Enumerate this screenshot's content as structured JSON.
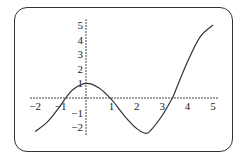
{
  "chart_data": {
    "type": "line",
    "title": "",
    "xlabel": "",
    "ylabel": "",
    "xlim": [
      -2,
      5
    ],
    "ylim": [
      -2.4,
      5.2
    ],
    "grid": false,
    "legend": null,
    "x_ticks": [
      "-2",
      "-1",
      "1",
      "2",
      "3",
      "4",
      "5"
    ],
    "y_ticks": [
      "5",
      "4",
      "3",
      "2",
      "1",
      "-1",
      "-2"
    ],
    "series": [
      {
        "name": "f(x)",
        "x": [
          -2,
          -1.5,
          -1,
          -0.8,
          -0.5,
          0,
          0.5,
          1,
          1.5,
          2,
          2.3,
          2.5,
          3,
          3.4,
          3.5,
          4,
          4.5,
          5
        ],
        "y": [
          -2.3,
          -1.6,
          -0.5,
          0,
          0.6,
          1.0,
          0.7,
          -0.1,
          -1.2,
          -2.1,
          -2.4,
          -2.3,
          -1.2,
          0,
          0.4,
          2.5,
          4.2,
          5.0
        ]
      }
    ]
  }
}
